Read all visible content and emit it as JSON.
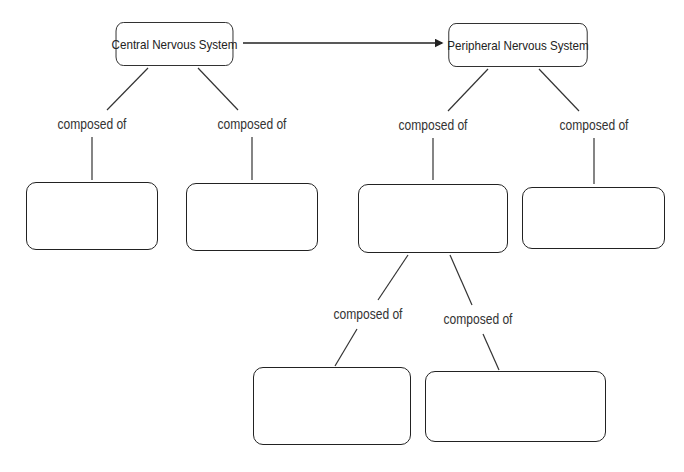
{
  "diagram": {
    "type": "concept-map",
    "nodes": [
      {
        "id": "cns",
        "label": "Central Nervous System"
      },
      {
        "id": "pns",
        "label": "Peripheral Nervous System"
      },
      {
        "id": "cns_a",
        "label": ""
      },
      {
        "id": "cns_b",
        "label": ""
      },
      {
        "id": "pns_a",
        "label": ""
      },
      {
        "id": "pns_b",
        "label": ""
      },
      {
        "id": "pns_a_1",
        "label": ""
      },
      {
        "id": "pns_a_2",
        "label": ""
      }
    ],
    "edges": [
      {
        "from": "cns",
        "to": "pns",
        "label": "",
        "arrow": true
      },
      {
        "from": "cns",
        "to": "cns_a",
        "label": "composed of"
      },
      {
        "from": "cns",
        "to": "cns_b",
        "label": "composed of"
      },
      {
        "from": "pns",
        "to": "pns_a",
        "label": "composed of"
      },
      {
        "from": "pns",
        "to": "pns_b",
        "label": "composed of"
      },
      {
        "from": "pns_a",
        "to": "pns_a_1",
        "label": "composed of"
      },
      {
        "from": "pns_a",
        "to": "pns_a_2",
        "label": "composed of"
      }
    ]
  }
}
